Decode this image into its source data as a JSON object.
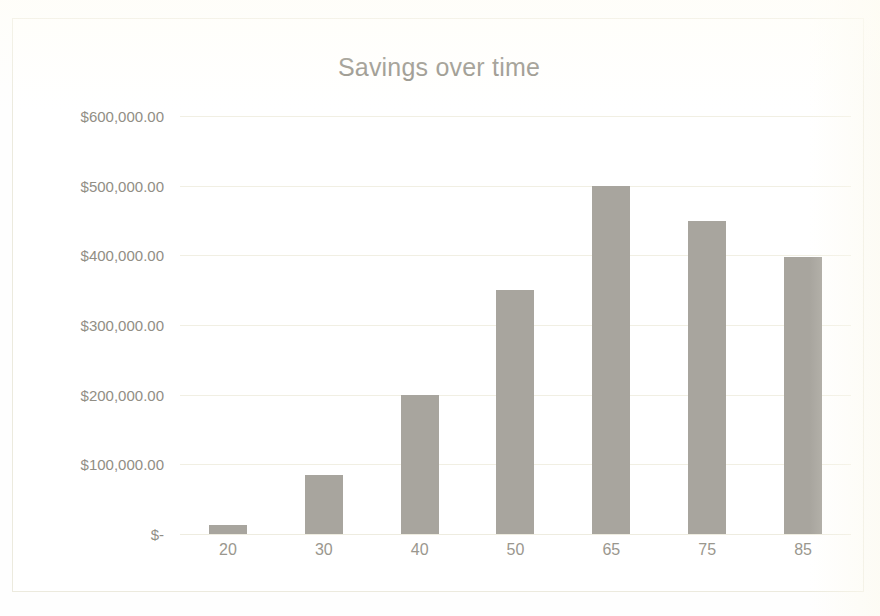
{
  "chart_data": {
    "type": "bar",
    "title": "Savings over time",
    "xlabel": "",
    "ylabel": "",
    "categories": [
      "20",
      "30",
      "40",
      "50",
      "65",
      "75",
      "85"
    ],
    "values": [
      13000,
      85000,
      200000,
      350000,
      500000,
      450000,
      397000
    ],
    "ylim": [
      0,
      600000
    ],
    "ytick_values": [
      600000,
      500000,
      400000,
      300000,
      200000,
      100000,
      0
    ],
    "ytick_labels": [
      "$600,000.00",
      "$500,000.00",
      "$400,000.00",
      "$300,000.00",
      "$200,000.00",
      "$100,000.00",
      "$-"
    ],
    "grid": true,
    "legend": false,
    "legend_position": "none",
    "series": [
      {
        "name": "Savings",
        "values": [
          13000,
          85000,
          200000,
          350000,
          500000,
          450000,
          397000
        ]
      }
    ],
    "colors": {
      "bar": "#a8a59e",
      "title_text": "#8e8b82",
      "tick_text": "#918e85",
      "gridline": "#f1efe3",
      "plot_background": "#ffffff",
      "chart_border": "#eceade"
    }
  },
  "clipped_header": ""
}
